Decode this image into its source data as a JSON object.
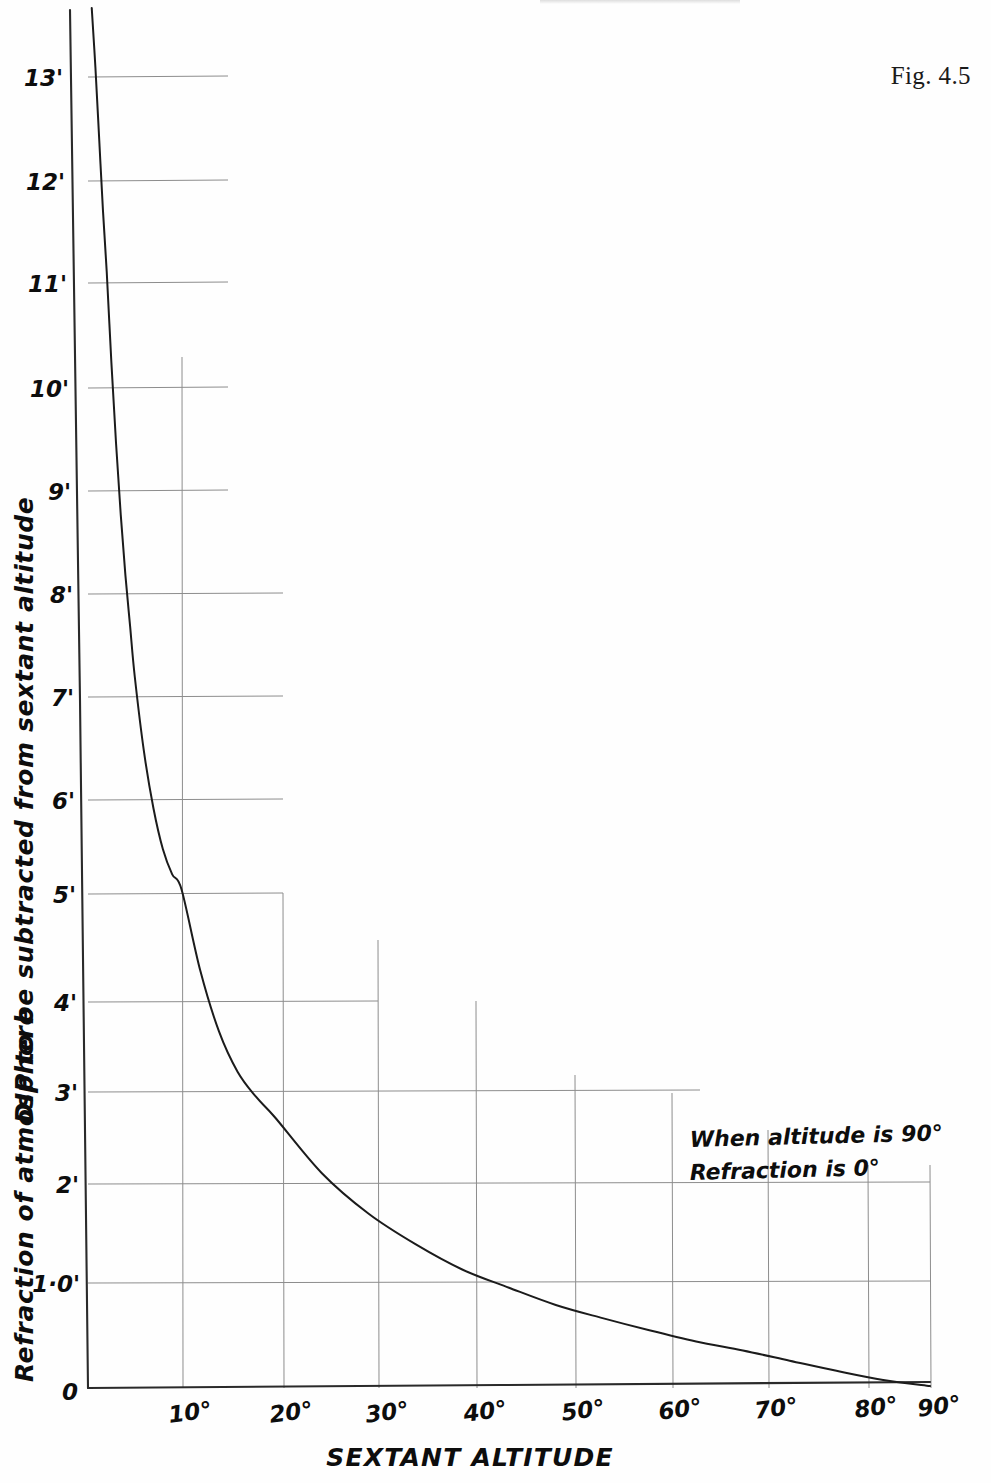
{
  "figure": {
    "label": "Fig. 4.5",
    "header_sliver": ""
  },
  "axes": {
    "x_title": "SEXTANT  ALTITUDE",
    "y_title_upper": "DIP to be subtracted from sextant altitude",
    "y_title_lower": "Refraction of atmosphere",
    "x_ticks": [
      "0",
      "10°",
      "20°",
      "30°",
      "40°",
      "50°",
      "60°",
      "70°",
      "80°",
      "90°"
    ],
    "y_ticks": [
      "0",
      "1·0'",
      "2'",
      "3'",
      "4'",
      "5'",
      "6'",
      "7'",
      "8'",
      "9'",
      "10'",
      "11'",
      "12'",
      "13'"
    ],
    "origin_label": "0"
  },
  "annotation": {
    "line1": "When altitude is 90°",
    "line2": "Refraction is 0°"
  },
  "colors": {
    "ink": "#0d0d0d",
    "curve": "#1b1b1b",
    "grid": "#8d8d8d",
    "axis": "#2a2a2a",
    "paper": "#fefefe"
  },
  "chart_data": {
    "type": "line",
    "title": "Fig. 4.5",
    "xlabel": "SEXTANT  ALTITUDE",
    "ylabel": "Refraction of atmosphere / DIP to be subtracted from sextant altitude",
    "xlim": [
      0,
      90
    ],
    "ylim": [
      0,
      13.6
    ],
    "grid": true,
    "legend": null,
    "x_tick_values": [
      0,
      10,
      20,
      30,
      40,
      50,
      60,
      70,
      80,
      90
    ],
    "x_tick_labels": [
      "0",
      "10°",
      "20°",
      "30°",
      "40°",
      "50°",
      "60°",
      "70°",
      "80°",
      "90°"
    ],
    "y_tick_values": [
      0,
      1.0,
      2,
      3,
      4,
      5,
      6,
      7,
      8,
      9,
      10,
      11,
      12,
      13
    ],
    "y_tick_labels": [
      "0",
      "1·0'",
      "2'",
      "3'",
      "4'",
      "5'",
      "6'",
      "7'",
      "8'",
      "9'",
      "10'",
      "11'",
      "12'",
      "13'"
    ],
    "y_unit": "arc minutes",
    "annotations": [
      "When altitude is 90°",
      "Refraction is 0°"
    ],
    "series": [
      {
        "name": "Refraction of atmosphere",
        "x": [
          0.4,
          0.8,
          1.2,
          1.6,
          2,
          2.5,
          3,
          3.5,
          4,
          4.5,
          5,
          6,
          7,
          8,
          9,
          10,
          12,
          14,
          16,
          18,
          20,
          25,
          30,
          35,
          40,
          45,
          50,
          55,
          60,
          65,
          70,
          75,
          80,
          85,
          90
        ],
        "y": [
          13.6,
          13.0,
          12.3,
          11.6,
          11.0,
          10.1,
          9.3,
          8.6,
          8.0,
          7.5,
          7.0,
          6.25,
          5.7,
          5.3,
          5.05,
          4.9,
          4.1,
          3.5,
          3.1,
          2.85,
          2.65,
          2.1,
          1.7,
          1.4,
          1.15,
          0.97,
          0.8,
          0.67,
          0.55,
          0.44,
          0.35,
          0.25,
          0.15,
          0.06,
          0.0
        ]
      }
    ],
    "notable_points": [
      {
        "altitude": 10,
        "refraction": 4.9
      },
      {
        "altitude": 20,
        "refraction": 2.65
      },
      {
        "altitude": 30,
        "refraction": 1.7
      },
      {
        "altitude": 40,
        "refraction": 1.15
      },
      {
        "altitude": 50,
        "refraction": 0.8
      },
      {
        "altitude": 60,
        "refraction": 0.55
      },
      {
        "altitude": 70,
        "refraction": 0.35
      },
      {
        "altitude": 80,
        "refraction": 0.15
      },
      {
        "altitude": 90,
        "refraction": 0.0
      }
    ]
  }
}
